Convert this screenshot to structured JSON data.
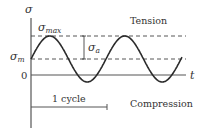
{
  "diagram": {
    "type": "fluctuating-stress-cycle",
    "axes": {
      "y_label": "σ",
      "x_label": "t",
      "zero_label": "0"
    },
    "levels": {
      "max_label_base": "σ",
      "max_label_sub": "max",
      "mean_label_base": "σ",
      "mean_label_sub": "m",
      "amplitude_label_base": "σ",
      "amplitude_label_sub": "a"
    },
    "regions": {
      "upper": "Tension",
      "lower": "Compression"
    },
    "cycle_label": "1 cycle",
    "colors": {
      "curve": "#2b2b2b",
      "axis": "#555555",
      "dashed": "#444444",
      "text": "#333333"
    },
    "wave": {
      "start_x": 31,
      "mean_y": 59,
      "amplitude_px": 23,
      "period_px": 75,
      "end_x": 182
    }
  }
}
